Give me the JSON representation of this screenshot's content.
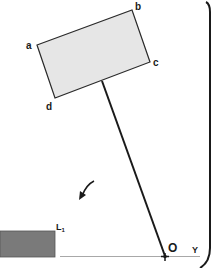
{
  "diagram": {
    "type": "pendulum-mechanism",
    "colors": {
      "plate_fill": "#e6e6e6",
      "plate_stroke": "#2a2a2a",
      "rod": "#1a1a1a",
      "block_fill": "#7a7a7a",
      "ground_line": "#a8a8a8",
      "bracket": "#1a1a1a",
      "text": "#1a1a1a"
    },
    "plate": {
      "corners": {
        "a": {
          "label": "a",
          "x": 37,
          "y": 45
        },
        "b": {
          "label": "b",
          "x": 132,
          "y": 10
        },
        "c": {
          "label": "c",
          "x": 150,
          "y": 62
        },
        "d": {
          "label": "d",
          "x": 55,
          "y": 98
        }
      }
    },
    "rod": {
      "from": {
        "x": 102,
        "y": 81
      },
      "to": {
        "x": 165,
        "y": 256
      }
    },
    "pivot": {
      "label": "O",
      "x": 165,
      "y": 256
    },
    "axis": {
      "label": "Y"
    },
    "block": {
      "label": "L",
      "subscript": "1"
    },
    "rotation_arrow": {
      "direction": "counterclockwise"
    }
  }
}
